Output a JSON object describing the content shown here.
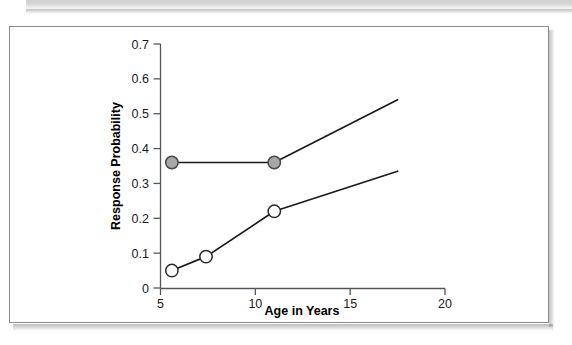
{
  "figure": {
    "background_color": "#ffffff",
    "frame_color": "#8c8c8c"
  },
  "chart_data": {
    "type": "line",
    "title": "",
    "subtitle": "",
    "xlabel": "Age in Years",
    "ylabel": "Response Probability",
    "xlim": [
      5,
      20
    ],
    "ylim": [
      0,
      0.7
    ],
    "xticks": [
      5,
      10,
      15,
      20
    ],
    "xtick_labels": [
      "5",
      "10",
      "15",
      "20"
    ],
    "yticks": [
      0,
      0.1,
      0.2,
      0.3,
      0.4,
      0.5,
      0.6,
      0.7
    ],
    "ytick_labels": [
      "0",
      "0.1",
      "0.2",
      "0.3",
      "0.4",
      "0.5",
      "0.6",
      "0.7"
    ],
    "grid": false,
    "legend": null,
    "legend_position": "none",
    "series": [
      {
        "name": "upper-series",
        "marker": "filled-circle",
        "marker_color": "#a8a8a8",
        "marker_edge_color": "#4a4a4a",
        "line_color": "#1b1b1b",
        "x": [
          5.6,
          11.0,
          17.5
        ],
        "y": [
          0.36,
          0.36,
          0.54
        ],
        "markers_at": [
          5.6,
          11.0
        ]
      },
      {
        "name": "lower-series",
        "marker": "open-circle",
        "marker_color": "#ffffff",
        "marker_edge_color": "#2b2b2b",
        "line_color": "#1b1b1b",
        "x": [
          5.6,
          7.4,
          11.0,
          17.5
        ],
        "y": [
          0.05,
          0.09,
          0.22,
          0.335
        ],
        "markers_at": [
          5.6,
          7.4,
          11.0
        ]
      }
    ]
  }
}
